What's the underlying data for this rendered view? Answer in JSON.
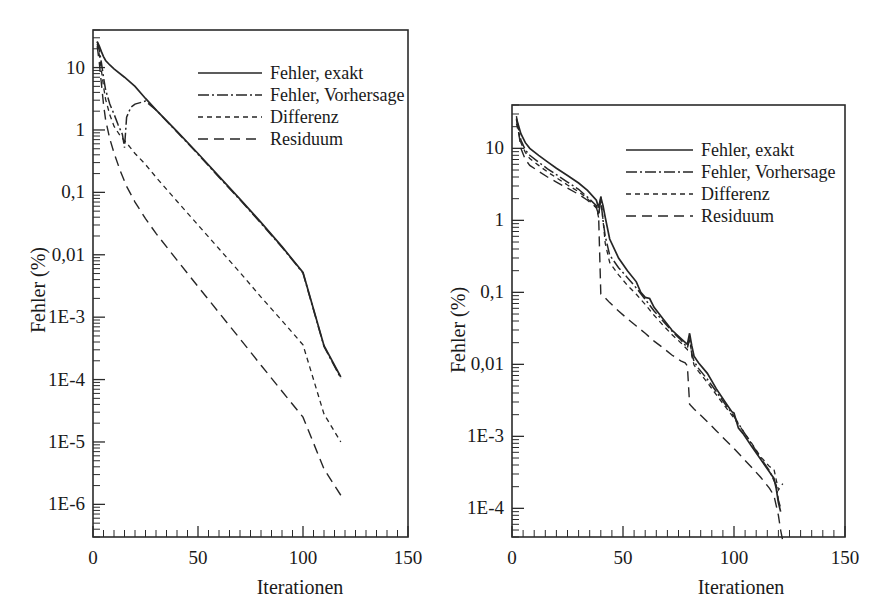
{
  "figure": {
    "background": "#ffffff",
    "ink_color": "#262626",
    "panels": 2
  },
  "chart_data": [
    {
      "id": "left",
      "type": "line",
      "title": "",
      "xlabel": "Iterationen",
      "ylabel": "Fehler (%)",
      "xscale": "linear",
      "yscale": "log",
      "xlim": [
        0,
        150
      ],
      "ylim": [
        3e-07,
        40
      ],
      "grid": false,
      "legend_position": "upper-right-inside",
      "xticks": [
        0,
        50,
        100,
        150
      ],
      "xticklabels": [
        "0",
        "50",
        "100",
        "150"
      ],
      "xtick_minor_step": 5,
      "yticks": [
        10,
        1,
        0.1,
        0.01,
        0.001,
        0.0001,
        1e-05,
        1e-06
      ],
      "yticklabels": [
        "10",
        "1",
        "0,1",
        "0,01",
        "1E-3",
        "1E-4",
        "1E-5",
        "1E-6"
      ],
      "series": [
        {
          "name": "Fehler, exakt",
          "style": "solid",
          "x": [
            2,
            3,
            4,
            5,
            6,
            8,
            10,
            15,
            20,
            25,
            30,
            40,
            50,
            60,
            70,
            80,
            90,
            100,
            110,
            118
          ],
          "values": [
            26,
            22,
            18,
            15,
            13,
            11,
            9.5,
            7.0,
            5.0,
            3.2,
            2.1,
            0.95,
            0.42,
            0.18,
            0.078,
            0.033,
            0.0135,
            0.0052,
            0.00035,
            0.00011
          ]
        },
        {
          "name": "Fehler, Vorhersage",
          "style": "dash-dot",
          "x": [
            2,
            3,
            4,
            5,
            6,
            8,
            10,
            12,
            14,
            15,
            16,
            18,
            20,
            25,
            30,
            40,
            50,
            60,
            70,
            80,
            90,
            100,
            110,
            118
          ],
          "values": [
            26,
            19,
            12,
            7.0,
            4.4,
            2.6,
            1.8,
            1.2,
            0.85,
            0.52,
            1.6,
            2.3,
            2.6,
            2.9,
            2.1,
            0.93,
            0.41,
            0.175,
            0.076,
            0.032,
            0.0132,
            0.0051,
            0.00034,
            0.000105
          ]
        },
        {
          "name": "Differenz",
          "style": "short-dash",
          "x": [
            2,
            3,
            4,
            5,
            6,
            8,
            10,
            13,
            16,
            20,
            25,
            30,
            40,
            50,
            60,
            70,
            80,
            90,
            100,
            110,
            118
          ],
          "values": [
            24,
            16,
            9.0,
            5.0,
            3.1,
            1.75,
            1.15,
            0.8,
            0.62,
            0.42,
            0.28,
            0.175,
            0.072,
            0.03,
            0.0125,
            0.0052,
            0.0021,
            0.00088,
            0.00036,
            2.8e-05,
            1e-05
          ]
        },
        {
          "name": "Residuum",
          "style": "long-dash",
          "x": [
            2,
            3,
            4,
            5,
            6,
            8,
            10,
            13,
            16,
            20,
            25,
            30,
            40,
            50,
            60,
            70,
            80,
            90,
            100,
            110,
            118
          ],
          "values": [
            22,
            12,
            5.5,
            2.6,
            1.45,
            0.72,
            0.43,
            0.22,
            0.125,
            0.07,
            0.038,
            0.022,
            0.0082,
            0.0031,
            0.00118,
            0.00045,
            0.00017,
            6.5e-05,
            2.5e-05,
            3.7e-06,
            1.4e-06
          ]
        }
      ]
    },
    {
      "id": "right",
      "type": "line",
      "title": "",
      "xlabel": "Iterationen",
      "ylabel": "Fehler (%)",
      "xscale": "linear",
      "yscale": "log",
      "xlim": [
        0,
        150
      ],
      "ylim": [
        4e-05,
        40
      ],
      "grid": false,
      "legend_position": "upper-right-inside",
      "xticks": [
        0,
        50,
        100,
        150
      ],
      "xticklabels": [
        "0",
        "50",
        "100",
        "150"
      ],
      "xtick_minor_step": 5,
      "yticks": [
        10,
        1,
        0.1,
        0.01,
        0.001,
        0.0001
      ],
      "yticklabels": [
        "10",
        "1",
        "0,1",
        "0,01",
        "1E-3",
        "1E-4"
      ],
      "series": [
        {
          "name": "Fehler, exakt",
          "style": "solid",
          "x": [
            2,
            4,
            6,
            8,
            12,
            16,
            20,
            25,
            30,
            34,
            38,
            39,
            40,
            41,
            42,
            44,
            48,
            52,
            56,
            58,
            60,
            62,
            64,
            68,
            72,
            76,
            79,
            80,
            81,
            82,
            84,
            88,
            92,
            96,
            99,
            100,
            102,
            104,
            108,
            112,
            116,
            118,
            119,
            120,
            121
          ],
          "values": [
            26,
            16,
            12,
            10.0,
            8.0,
            6.5,
            5.3,
            4.2,
            3.3,
            2.6,
            1.9,
            1.5,
            2.1,
            1.6,
            1.1,
            0.55,
            0.3,
            0.2,
            0.14,
            0.1,
            0.085,
            0.082,
            0.062,
            0.043,
            0.03,
            0.023,
            0.019,
            0.027,
            0.018,
            0.013,
            0.0105,
            0.0075,
            0.0046,
            0.003,
            0.0022,
            0.0021,
            0.0013,
            0.0011,
            0.00072,
            0.00048,
            0.00032,
            0.00026,
            0.00019,
            0.00012,
            9e-05
          ]
        },
        {
          "name": "Fehler, Vorhersage",
          "style": "dash-dot",
          "x": [
            2,
            4,
            6,
            8,
            12,
            16,
            20,
            25,
            30,
            34,
            38,
            39,
            40,
            41,
            42,
            44,
            48,
            52,
            56,
            60,
            64,
            68,
            72,
            76,
            79,
            80,
            81,
            82,
            84,
            88,
            92,
            96,
            100,
            104,
            108,
            112,
            116,
            119,
            120,
            121
          ],
          "values": [
            25,
            13,
            9.5,
            8.0,
            6.4,
            5.2,
            4.3,
            3.4,
            2.7,
            2.1,
            1.6,
            1.2,
            1.9,
            1.0,
            0.6,
            0.33,
            0.22,
            0.16,
            0.115,
            0.08,
            0.055,
            0.04,
            0.029,
            0.022,
            0.017,
            0.022,
            0.014,
            0.011,
            0.0088,
            0.0062,
            0.0042,
            0.0028,
            0.0019,
            0.0012,
            0.00078,
            0.0005,
            0.00033,
            0.00021,
            0.00013,
            0.0001
          ]
        },
        {
          "name": "Differenz",
          "style": "short-dash",
          "x": [
            2,
            4,
            6,
            8,
            12,
            16,
            20,
            25,
            30,
            34,
            38,
            39,
            40,
            41,
            42,
            44,
            48,
            52,
            56,
            60,
            64,
            68,
            72,
            76,
            79,
            80,
            81,
            82,
            84,
            88,
            92,
            96,
            100,
            104,
            108,
            112,
            116,
            118,
            120,
            122
          ],
          "values": [
            22,
            12,
            8.8,
            7.2,
            5.8,
            4.7,
            3.9,
            3.1,
            2.5,
            2.0,
            1.5,
            1.1,
            2.2,
            1.0,
            0.48,
            0.26,
            0.175,
            0.125,
            0.094,
            0.068,
            0.048,
            0.035,
            0.026,
            0.02,
            0.016,
            0.025,
            0.013,
            0.0098,
            0.008,
            0.0056,
            0.0038,
            0.0026,
            0.0018,
            0.0012,
            0.0008,
            0.00052,
            0.00038,
            0.00035,
            0.00018,
            0.00022
          ]
        },
        {
          "name": "Residuum",
          "style": "long-dash",
          "x": [
            2,
            4,
            6,
            8,
            12,
            16,
            20,
            25,
            30,
            34,
            38,
            39,
            40,
            41,
            44,
            48,
            52,
            56,
            60,
            64,
            68,
            72,
            76,
            78,
            79,
            80,
            82,
            84,
            88,
            92,
            96,
            100,
            104,
            108,
            112,
            116,
            118,
            119,
            120,
            121,
            122
          ],
          "values": [
            28,
            10,
            7.0,
            5.8,
            4.8,
            4.0,
            3.4,
            2.8,
            2.3,
            1.9,
            1.5,
            1.2,
            0.095,
            0.09,
            0.072,
            0.055,
            0.043,
            0.034,
            0.027,
            0.021,
            0.017,
            0.0135,
            0.0112,
            0.0105,
            0.0095,
            0.0028,
            0.0024,
            0.0021,
            0.0016,
            0.0012,
            0.0009,
            0.00068,
            0.0005,
            0.00037,
            0.00027,
            0.00019,
            0.00015,
            0.00011,
            8e-05,
            5e-05,
            3.5e-05
          ]
        }
      ]
    }
  ],
  "left_panel": {
    "y_axis_title": "Fehler (%)",
    "x_axis_title": "Iterationen",
    "y_tick_labels": [
      "10",
      "1",
      "0,1",
      "0,01",
      "1E-3",
      "1E-4",
      "1E-5",
      "1E-6"
    ],
    "x_tick_labels": [
      "0",
      "50",
      "100",
      "150"
    ],
    "legend": {
      "items": [
        {
          "label": "Fehler, exakt",
          "style": "solid"
        },
        {
          "label": "Fehler, Vorhersage",
          "style": "dash-dot"
        },
        {
          "label": "Differenz",
          "style": "short-dash"
        },
        {
          "label": "Residuum",
          "style": "long-dash"
        }
      ]
    }
  },
  "right_panel": {
    "y_axis_title": "Fehler (%)",
    "x_axis_title": "Iterationen",
    "y_tick_labels": [
      "10",
      "1",
      "0,1",
      "0,01",
      "1E-3",
      "1E-4"
    ],
    "x_tick_labels": [
      "0",
      "50",
      "100",
      "150"
    ],
    "legend": {
      "items": [
        {
          "label": "Fehler, exakt",
          "style": "solid"
        },
        {
          "label": "Fehler, Vorhersage",
          "style": "dash-dot"
        },
        {
          "label": "Differenz",
          "style": "short-dash"
        },
        {
          "label": "Residuum",
          "style": "long-dash"
        }
      ]
    }
  }
}
